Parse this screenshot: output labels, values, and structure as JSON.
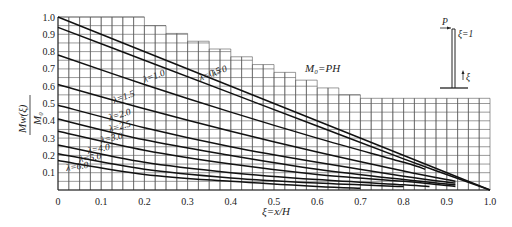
{
  "chart_data": {
    "type": "line",
    "title": "",
    "annotation": "M0=PH",
    "xlabel": "ξ=x/H",
    "ylabel": "Mw(ξ)/M0",
    "xlim": [
      0,
      1.0
    ],
    "ylim": [
      0,
      1.0
    ],
    "x_ticks": [
      "0",
      "0.1",
      "0.2",
      "0.3",
      "0.4",
      "0.5",
      "0.6",
      "0.7",
      "0.8",
      "0.9",
      "1.0"
    ],
    "y_ticks": [
      "0.1",
      "0.2",
      "0.3",
      "0.4",
      "0.5",
      "0.6",
      "0.7",
      "0.8",
      "0.9",
      "1.0"
    ],
    "grid": true,
    "legend_position": "inline labels on curves",
    "inset_diagram": {
      "load_label": "P",
      "top_label": "ξ=1",
      "axis_label": "ξ"
    },
    "series": [
      {
        "name": "λ=0",
        "x": [
          0,
          1.0
        ],
        "values": [
          1.0,
          0.0
        ]
      },
      {
        "name": "λ=0.5",
        "x": [
          0,
          0.2,
          0.4,
          0.6,
          0.8,
          1.0
        ],
        "values": [
          0.94,
          0.75,
          0.56,
          0.37,
          0.18,
          0.0
        ]
      },
      {
        "name": "λ=1.0",
        "x": [
          0,
          0.2,
          0.4,
          0.6,
          0.8,
          0.85
        ],
        "values": [
          0.78,
          0.61,
          0.45,
          0.3,
          0.16,
          0.12
        ]
      },
      {
        "name": "λ=1.5",
        "x": [
          0,
          0.2,
          0.4,
          0.6,
          0.8,
          0.92
        ],
        "values": [
          0.61,
          0.47,
          0.34,
          0.22,
          0.11,
          0.05
        ]
      },
      {
        "name": "λ=2.0",
        "x": [
          0,
          0.2,
          0.4,
          0.6,
          0.8,
          0.92
        ],
        "values": [
          0.49,
          0.36,
          0.25,
          0.16,
          0.08,
          0.04
        ]
      },
      {
        "name": "λ=2.5",
        "x": [
          0,
          0.2,
          0.4,
          0.6,
          0.8,
          0.92
        ],
        "values": [
          0.41,
          0.29,
          0.2,
          0.12,
          0.06,
          0.03
        ]
      },
      {
        "name": "λ=3.0",
        "x": [
          0,
          0.2,
          0.4,
          0.6,
          0.8,
          0.92
        ],
        "values": [
          0.34,
          0.23,
          0.15,
          0.09,
          0.05,
          0.02
        ]
      },
      {
        "name": "λ=4.0",
        "x": [
          0,
          0.2,
          0.4,
          0.6,
          0.8,
          0.86
        ],
        "values": [
          0.26,
          0.16,
          0.1,
          0.06,
          0.03,
          0.02
        ]
      },
      {
        "name": "λ=5.0",
        "x": [
          0,
          0.2,
          0.4,
          0.6,
          0.8
        ],
        "values": [
          0.21,
          0.12,
          0.07,
          0.04,
          0.02
        ]
      },
      {
        "name": "λ=6.0",
        "x": [
          0,
          0.2,
          0.4,
          0.6,
          0.7
        ],
        "values": [
          0.17,
          0.09,
          0.05,
          0.02,
          0.01
        ]
      }
    ]
  },
  "labels": {
    "annotation": "M₀=PH",
    "xlabel": "ξ=x/H",
    "ylabel_num": "Mw(ξ)",
    "ylabel_den": "M₀",
    "inset_P": "P",
    "inset_top": "ξ=1",
    "inset_xi": "ξ"
  }
}
